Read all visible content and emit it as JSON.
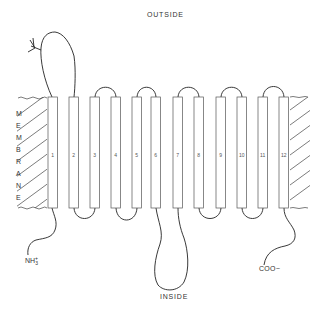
{
  "labels": {
    "outside": "OUTSIDE",
    "inside": "INSIDE",
    "n_terminus": "NH3+",
    "n_terminus_main": "NH",
    "n_terminus_sub": "3",
    "n_terminus_sup": "+",
    "c_terminus": "COO−",
    "membrane_letters": [
      "M",
      "E",
      "M",
      "B",
      "R",
      "A",
      "N",
      "E"
    ]
  },
  "helices": [
    {
      "num": "1",
      "x": 48
    },
    {
      "num": "2",
      "x": 69
    },
    {
      "num": "3",
      "x": 90
    },
    {
      "num": "4",
      "x": 111
    },
    {
      "num": "5",
      "x": 132
    },
    {
      "num": "6",
      "x": 151
    },
    {
      "num": "7",
      "x": 173
    },
    {
      "num": "8",
      "x": 194
    },
    {
      "num": "9",
      "x": 216
    },
    {
      "num": "10",
      "x": 237
    },
    {
      "num": "11",
      "x": 258
    },
    {
      "num": "12",
      "x": 279
    }
  ],
  "membrane": {
    "top": 97,
    "bottom": 208,
    "left_region": [
      17,
      47
    ],
    "right_region": [
      290,
      310
    ]
  },
  "colors": {
    "line": "#333333",
    "helix_fill": "#ffffff",
    "text": "#333333"
  }
}
